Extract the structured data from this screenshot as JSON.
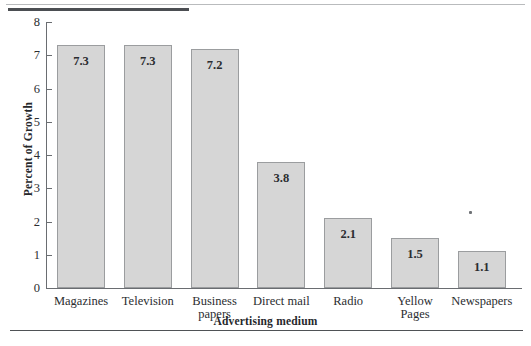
{
  "chart_data": {
    "type": "bar",
    "title": "",
    "xlabel": "Advertising medium",
    "ylabel": "Percent of Growth",
    "categories": [
      "Magazines",
      "Television",
      "Business papers",
      "Direct mail",
      "Radio",
      "Yellow Pages",
      "Newspapers"
    ],
    "category_lines": [
      [
        "Magazines"
      ],
      [
        "Television"
      ],
      [
        "Business",
        "papers"
      ],
      [
        "Direct mail"
      ],
      [
        "Radio"
      ],
      [
        "Yellow",
        "Pages"
      ],
      [
        "Newspapers"
      ]
    ],
    "values": [
      7.3,
      7.3,
      7.2,
      3.8,
      2.1,
      1.5,
      1.1
    ],
    "value_labels": [
      "7.3",
      "7.3",
      "7.2",
      "3.8",
      "2.1",
      "1.5",
      "1.1"
    ],
    "ylim": [
      0,
      8
    ],
    "ytick_labels": [
      "0",
      "1",
      "2",
      "3",
      "4",
      "5",
      "6",
      "7",
      "8"
    ],
    "yticks": [
      0,
      1,
      2,
      3,
      4,
      5,
      6,
      7,
      8
    ],
    "grid": false,
    "legend": null,
    "bar_fill_color": "#d6d6d6",
    "bar_border_color": "#9b9d9f",
    "axis_color": "#6a6d71",
    "text_color": "#2b2d30"
  }
}
